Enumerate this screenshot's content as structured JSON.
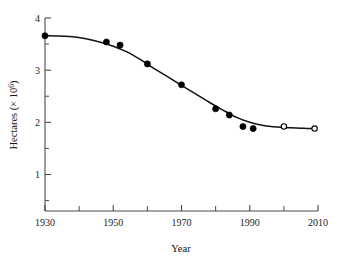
{
  "chart_data": {
    "type": "scatter",
    "title": "",
    "xlabel": "Year",
    "ylabel": "Hectares (× 10⁶)",
    "xlim": [
      1930,
      2010
    ],
    "ylim": [
      0.3,
      4.0
    ],
    "grid": false,
    "legend_position": "none",
    "x_ticks_major": [
      1930,
      1950,
      1970,
      1990,
      2010
    ],
    "x_tick_labels": [
      "1930",
      "1950",
      "1970",
      "1990",
      "2010"
    ],
    "x_ticks_minor": [
      1940,
      1960,
      1980,
      2000
    ],
    "y_ticks_major": [
      1,
      2,
      3,
      4
    ],
    "y_tick_labels": [
      "1",
      "2",
      "3",
      "4"
    ],
    "y_ticks_minor": [
      0.5,
      1.5,
      2.5,
      3.5
    ],
    "series": [
      {
        "name": "observed",
        "marker": "filled-circle",
        "x": [
          1930,
          1948,
          1952,
          1960,
          1970,
          1980,
          1984,
          1988,
          1991
        ],
        "values": [
          3.66,
          3.54,
          3.48,
          3.12,
          2.72,
          2.26,
          2.14,
          1.92,
          1.88
        ]
      },
      {
        "name": "projected",
        "marker": "open-circle",
        "x": [
          2000,
          2009
        ],
        "values": [
          1.92,
          1.88
        ]
      }
    ],
    "fit_curve": {
      "name": "smoothed trend",
      "x": [
        1930,
        1934,
        1938,
        1942,
        1946,
        1950,
        1954,
        1958,
        1962,
        1966,
        1970,
        1974,
        1978,
        1982,
        1986,
        1990,
        1994,
        1998,
        2002,
        2006,
        2009
      ],
      "values": [
        3.66,
        3.655,
        3.64,
        3.6,
        3.54,
        3.46,
        3.35,
        3.2,
        3.03,
        2.87,
        2.71,
        2.55,
        2.39,
        2.24,
        2.1,
        2.0,
        1.94,
        1.91,
        1.895,
        1.885,
        1.88
      ]
    },
    "colors": {
      "axis": "#4a4a4a",
      "curve": "#111111",
      "marker_filled": "#000000",
      "marker_open_fill": "#ffffff",
      "marker_open_stroke": "#000000",
      "background": "#ffffff",
      "text": "#222222"
    }
  }
}
